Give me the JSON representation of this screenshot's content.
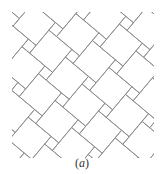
{
  "figure": {
    "type": "pythagorean-tiling",
    "line_color": "#8a8a8a",
    "line_width": 0.9,
    "large_square_side": 30,
    "small_square_side": 10,
    "rotation_deg": 40,
    "clip_region": {
      "x": 12,
      "y": 12,
      "width": 142,
      "height": 146
    }
  },
  "caption": {
    "open": "(",
    "letter": "a",
    "close": ")"
  }
}
